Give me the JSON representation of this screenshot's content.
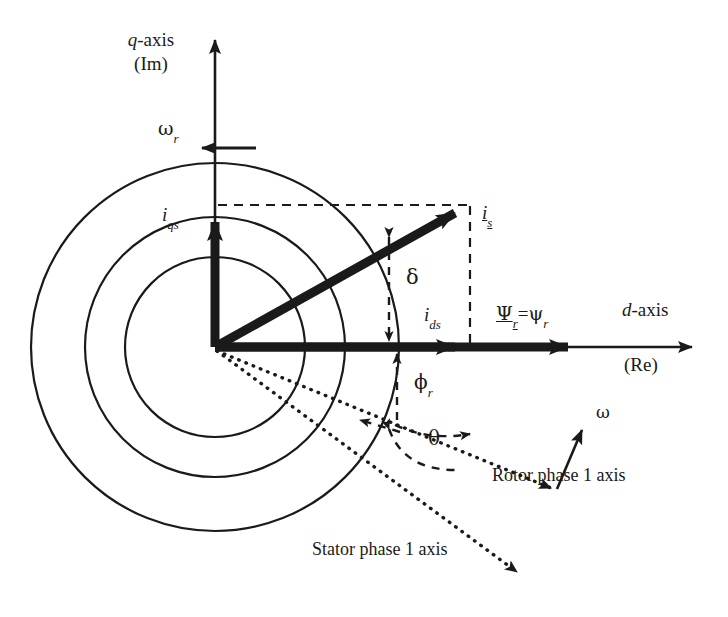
{
  "figure": {
    "type": "phasor-vector-diagram",
    "width": 728,
    "height": 617,
    "background_color": "#ffffff",
    "ink_color": "#1a1a1a"
  },
  "axes": {
    "vertical": {
      "name": "q-axis",
      "label_main": "q",
      "label_main_suffix": "-axis",
      "label_secondary": "(Im)",
      "direction": "up",
      "origin": [
        215,
        347
      ],
      "tip": [
        215,
        32
      ]
    },
    "horizontal": {
      "name": "d-axis",
      "label_main": "d",
      "label_main_suffix": "-axis",
      "label_secondary": "(Re)",
      "direction": "right",
      "origin": [
        215,
        347
      ],
      "tip": [
        700,
        347
      ]
    }
  },
  "circles": {
    "count": 3,
    "center": [
      215,
      347
    ],
    "radii": [
      90,
      130,
      184
    ],
    "stroke_width": 2.2,
    "fill": "none"
  },
  "vectors": [
    {
      "id": "stator-current",
      "label": "i",
      "label_sub": "s",
      "underlined": true,
      "style": "thick-solid",
      "from": [
        215,
        347
      ],
      "to": [
        470,
        205
      ],
      "label_pos": [
        484,
        212
      ]
    },
    {
      "id": "q-axis-current-component",
      "label": "i",
      "label_sub": "qs",
      "underlined": false,
      "style": "thick-solid",
      "from": [
        215,
        347
      ],
      "to": [
        215,
        208
      ],
      "label_pos": [
        168,
        216
      ]
    },
    {
      "id": "d-axis-current-component",
      "label": "i",
      "label_sub": "ds",
      "underlined": false,
      "style": "thick-solid",
      "from": [
        215,
        347
      ],
      "to": [
        470,
        347
      ],
      "label_pos": [
        428,
        318
      ]
    },
    {
      "id": "rotor-flux",
      "label_underlined": "Ψ",
      "label_sub_underlined": "r",
      "label_equals": "=",
      "label_plain": "ψ",
      "label_sub_plain": "r",
      "style": "thick-solid",
      "from": [
        215,
        347
      ],
      "to": [
        585,
        347
      ],
      "label_pos": [
        500,
        318
      ]
    }
  ],
  "dotted_axes": [
    {
      "id": "rotor-phase-1-axis",
      "label": "Rotor phase 1 axis",
      "from": [
        215,
        350
      ],
      "to": [
        560,
        492
      ],
      "label_pos": [
        502,
        480
      ],
      "arrowhead": true
    },
    {
      "id": "stator-phase-1-axis",
      "label": "Stator phase 1 axis",
      "from": [
        215,
        350
      ],
      "to": [
        525,
        578
      ],
      "label_pos": [
        320,
        552
      ],
      "arrowhead": true
    }
  ],
  "angles": [
    {
      "id": "delta",
      "symbol": "δ",
      "description": "angle between stator current vector and d-axis, shown as vertical double arrow",
      "label_pos": [
        408,
        273
      ],
      "marker": "vertical-double-arrow",
      "marker_x": 388,
      "marker_y_top": 230,
      "marker_y_bottom": 347
    },
    {
      "id": "phi-r",
      "symbol": "ϕ",
      "symbol_sub": "r",
      "description": "angle of rotor flux relative to rotor phase 1 axis, vertical dashed double arrow",
      "label_pos": [
        418,
        382
      ],
      "marker": "vertical-double-arrow",
      "marker_x": 396,
      "marker_y_top": 352,
      "marker_y_bottom": 426
    },
    {
      "id": "theta",
      "symbol": "θ",
      "description": "angle between rotor phase 1 axis and stator phase 1 axis, dashed arc with double arrowheads",
      "label_pos": [
        432,
        438
      ],
      "marker": "dashed-arc-double-arrow"
    }
  ],
  "speed_arrows": [
    {
      "id": "rotor-speed",
      "symbol": "ω",
      "symbol_sub": "r",
      "direction": "left",
      "from": [
        255,
        148
      ],
      "to": [
        196,
        148
      ],
      "label_pos": [
        160,
        122
      ]
    },
    {
      "id": "synchronous-speed",
      "symbol": "ω",
      "symbol_sub": "",
      "direction": "up-right",
      "from": [
        557,
        487
      ],
      "to": [
        583,
        424
      ],
      "label_pos": [
        598,
        413
      ]
    }
  ],
  "dashed_projection_lines": [
    {
      "id": "iqs-projection",
      "from": [
        215,
        205
      ],
      "to": [
        470,
        205
      ],
      "orientation": "horizontal"
    },
    {
      "id": "ids-projection",
      "from": [
        470,
        205
      ],
      "to": [
        470,
        347
      ],
      "orientation": "vertical"
    }
  ]
}
